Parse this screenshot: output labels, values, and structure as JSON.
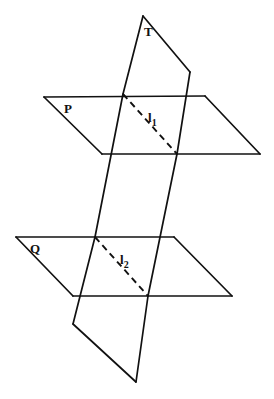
{
  "figure": {
    "background_color": "#ffffff",
    "stroke_color": "#111111",
    "width": 274,
    "height": 399,
    "labels": {
      "plane_t": "T",
      "plane_p": "P",
      "plane_q": "Q",
      "line_1_base": "l",
      "line_1_sub": "1",
      "line_2_base": "l",
      "line_2_sub": "2"
    },
    "planes": [
      {
        "name": "plane-p",
        "label": "P",
        "style": "solid",
        "description": "upper horizontal parallelogram",
        "points": "44,97 205,96 260,154 102,154"
      },
      {
        "name": "plane-q",
        "label": "Q",
        "style": "solid",
        "description": "lower horizontal parallelogram",
        "points": "16,237 174,237 232,296 73,296"
      },
      {
        "name": "plane-t",
        "label": "T",
        "style": "solid",
        "description": "slanted transversal plane crossing both horizontal planes",
        "points": "143,16 190,72 177,154 148,296 136,382 73,324 95,237 123,94"
      }
    ],
    "intersection_lines": [
      {
        "name": "line-l1",
        "label": "l",
        "subscript": "1",
        "style": "dashed",
        "description": "intersection of plane T with plane P",
        "x1": 123,
        "y1": 94,
        "x2": 177,
        "y2": 154,
        "label_x": 152,
        "label_y": 122
      },
      {
        "name": "line-l2",
        "label": "l",
        "subscript": "2",
        "style": "dashed",
        "description": "intersection of plane T with plane Q",
        "x1": 95,
        "y1": 237,
        "x2": 148,
        "y2": 296,
        "label_x": 124,
        "label_y": 264
      }
    ]
  }
}
